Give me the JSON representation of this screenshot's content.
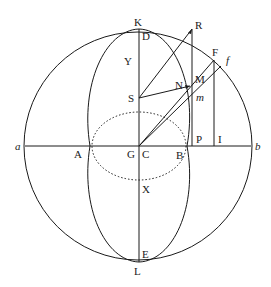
{
  "diagram": {
    "type": "geometric-construction",
    "colors": {
      "stroke": "#1a1a1a",
      "background": "#ffffff"
    },
    "labels": {
      "K": "K",
      "D": "D",
      "R": "R",
      "F": "F",
      "f": "f",
      "Y": "Y",
      "M": "M",
      "N": "N",
      "S": "S",
      "m": "m",
      "a": "a",
      "A": "A",
      "G": "G",
      "C": "C",
      "B": "B",
      "P": "P",
      "I": "I",
      "b": "b",
      "X": "X",
      "E": "E",
      "L": "L"
    }
  }
}
